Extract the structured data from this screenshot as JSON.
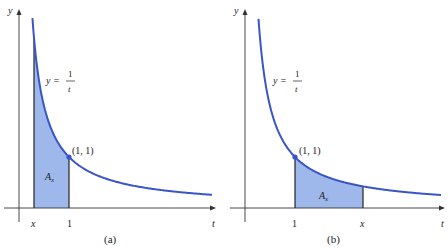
{
  "figure": {
    "panels": [
      {
        "id": "a",
        "caption": "(a)",
        "y_axis_label": "y",
        "t_axis_label": "t",
        "equation_lhs": "y =",
        "equation_num": "1",
        "equation_den": "t",
        "point_label": "(1, 1)",
        "area_label": "A",
        "area_subscript": "x",
        "tick_labels": [
          "x",
          "1"
        ],
        "shaded_from": 0.3,
        "shaded_to": 1
      },
      {
        "id": "b",
        "caption": "(b)",
        "y_axis_label": "y",
        "t_axis_label": "t",
        "equation_lhs": "y =",
        "equation_num": "1",
        "equation_den": "t",
        "point_label": "(1, 1)",
        "area_label": "A",
        "area_subscript": "x",
        "tick_labels": [
          "1",
          "x"
        ],
        "shaded_from": 1,
        "shaded_to": 2.36
      }
    ],
    "colors": {
      "curve": "#3a55c8",
      "fill": "#9fb8ec",
      "axis": "#333333",
      "point": "#3a55c8"
    }
  }
}
